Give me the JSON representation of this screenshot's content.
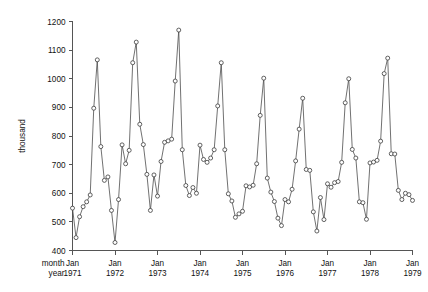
{
  "chart_data": {
    "type": "line",
    "title": "",
    "subtitle": "",
    "xlabel": "",
    "ylabel": "thousand",
    "x_axis_row_labels": [
      "month",
      "year"
    ],
    "ylim": [
      400,
      1200
    ],
    "yticks": [
      400,
      500,
      600,
      700,
      800,
      900,
      1000,
      1100,
      1200
    ],
    "ytick_labels": [
      "400",
      "500",
      "600",
      "700",
      "800",
      "900",
      "1000",
      "1100",
      "1200"
    ],
    "xlim": [
      "1971-01",
      "1979-01"
    ],
    "xticks": [
      "Jan 1971",
      "Jan 1972",
      "Jan 1973",
      "Jan 1974",
      "Jan 1975",
      "Jan 1976",
      "Jan 1977",
      "Jan 1978",
      "Jan 1979"
    ],
    "xtick_month_labels": [
      "Jan",
      "Jan",
      "Jan",
      "Jan",
      "Jan",
      "Jan",
      "Jan",
      "Jan",
      "Jan"
    ],
    "xtick_year_labels": [
      "1971",
      "1972",
      "1973",
      "1974",
      "1975",
      "1976",
      "1977",
      "1978",
      "1979"
    ],
    "grid": false,
    "legend": null,
    "marker": "open-circle",
    "series_color": "#4d4d4d",
    "series": [
      {
        "name": "thousand",
        "x": [
          "1971-01",
          "1971-02",
          "1971-03",
          "1971-04",
          "1971-05",
          "1971-06",
          "1971-07",
          "1971-08",
          "1971-09",
          "1971-10",
          "1971-11",
          "1971-12",
          "1972-01",
          "1972-02",
          "1972-03",
          "1972-04",
          "1972-05",
          "1972-06",
          "1972-07",
          "1972-08",
          "1972-09",
          "1972-10",
          "1972-11",
          "1972-12",
          "1973-01",
          "1973-02",
          "1973-03",
          "1973-04",
          "1973-05",
          "1973-06",
          "1973-07",
          "1973-08",
          "1973-09",
          "1973-10",
          "1973-11",
          "1973-12",
          "1974-01",
          "1974-02",
          "1974-03",
          "1974-04",
          "1974-05",
          "1974-06",
          "1974-07",
          "1974-08",
          "1974-09",
          "1974-10",
          "1974-11",
          "1974-12",
          "1975-01",
          "1975-02",
          "1975-03",
          "1975-04",
          "1975-05",
          "1975-06",
          "1975-07",
          "1975-08",
          "1975-09",
          "1975-10",
          "1975-11",
          "1975-12",
          "1976-01",
          "1976-02",
          "1976-03",
          "1976-04",
          "1976-05",
          "1976-06",
          "1976-07",
          "1976-08",
          "1976-09",
          "1976-10",
          "1976-11",
          "1976-12",
          "1977-01",
          "1977-02",
          "1977-03",
          "1977-04",
          "1977-05",
          "1977-06",
          "1977-07",
          "1977-08",
          "1977-09",
          "1977-10",
          "1977-11",
          "1977-12",
          "1978-01",
          "1978-02",
          "1978-03",
          "1978-04",
          "1978-05",
          "1978-06",
          "1978-07",
          "1978-08",
          "1978-09",
          "1978-10",
          "1978-11",
          "1978-12",
          "1979-01"
        ],
        "values": [
          548,
          445,
          518,
          553,
          570,
          594,
          897,
          1066,
          763,
          645,
          657,
          540,
          428,
          578,
          769,
          703,
          750,
          1056,
          1128,
          841,
          770,
          666,
          540,
          664,
          590,
          711,
          778,
          783,
          789,
          992,
          1170,
          752,
          627,
          592,
          620,
          600,
          768,
          718,
          708,
          723,
          752,
          905,
          1056,
          752,
          598,
          573,
          516,
          528,
          537,
          626,
          622,
          628,
          703,
          872,
          1002,
          653,
          604,
          571,
          513,
          487,
          578,
          570,
          614,
          713,
          824,
          932,
          683,
          680,
          535,
          468,
          585,
          508,
          633,
          621,
          637,
          641,
          708,
          916,
          1000,
          753,
          723,
          570,
          567,
          509,
          706,
          709,
          715,
          782,
          1018,
          1072,
          738,
          737,
          610,
          578,
          600,
          595,
          575
        ]
      }
    ]
  }
}
